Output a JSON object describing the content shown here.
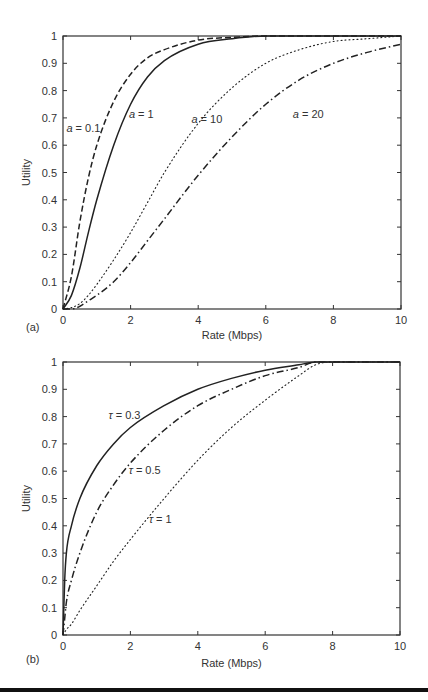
{
  "chart_data": [
    {
      "type": "line",
      "panel_label": "(a)",
      "title": "",
      "xlabel": "Rate (Mbps)",
      "ylabel": "Utility",
      "xlim": [
        0,
        10
      ],
      "ylim": [
        0,
        1
      ],
      "xticks": [
        0,
        2,
        4,
        6,
        8,
        10
      ],
      "yticks": [
        0,
        0.1,
        0.2,
        0.3,
        0.4,
        0.5,
        0.6,
        0.7,
        0.8,
        0.9,
        1
      ],
      "grid": false,
      "legend": "inline annotations",
      "x": [
        0,
        0.25,
        0.5,
        0.75,
        1,
        1.5,
        2,
        2.5,
        3,
        4,
        5,
        6,
        7,
        8,
        9,
        10
      ],
      "series": [
        {
          "name": "a = 0.1",
          "style": "dashed",
          "values": [
            0,
            0.12,
            0.32,
            0.48,
            0.6,
            0.76,
            0.86,
            0.92,
            0.95,
            0.985,
            0.995,
            1,
            1,
            1,
            1,
            1
          ]
        },
        {
          "name": "a = 1",
          "style": "solid",
          "values": [
            0,
            0.05,
            0.15,
            0.28,
            0.4,
            0.6,
            0.75,
            0.85,
            0.91,
            0.97,
            0.99,
            1,
            1,
            1,
            1,
            1
          ]
        },
        {
          "name": "a = 10",
          "style": "dotted",
          "values": [
            0,
            0.005,
            0.02,
            0.05,
            0.09,
            0.18,
            0.28,
            0.39,
            0.5,
            0.68,
            0.81,
            0.9,
            0.95,
            0.98,
            0.99,
            1
          ]
        },
        {
          "name": "a = 20",
          "style": "dashdot",
          "values": [
            0,
            0.0,
            0.01,
            0.03,
            0.05,
            0.1,
            0.17,
            0.25,
            0.33,
            0.49,
            0.63,
            0.75,
            0.84,
            0.9,
            0.94,
            0.97
          ]
        }
      ],
      "annotations": [
        {
          "text": "a = 0.1",
          "x": 0.1,
          "y": 0.65
        },
        {
          "text": "a = 1",
          "x": 1.95,
          "y": 0.7
        },
        {
          "text": "a = 10",
          "x": 3.8,
          "y": 0.68
        },
        {
          "text": "a = 20",
          "x": 6.8,
          "y": 0.7
        }
      ]
    },
    {
      "type": "line",
      "panel_label": "(b)",
      "title": "",
      "xlabel": "Rate (Mbps)",
      "ylabel": "Utility",
      "xlim": [
        0,
        10
      ],
      "ylim": [
        0,
        1
      ],
      "xticks": [
        0,
        2,
        4,
        6,
        8,
        10
      ],
      "yticks": [
        0,
        0.1,
        0.2,
        0.3,
        0.4,
        0.5,
        0.6,
        0.7,
        0.8,
        0.9,
        1
      ],
      "grid": false,
      "legend": "inline annotations",
      "x": [
        0,
        0.05,
        0.1,
        0.25,
        0.5,
        1,
        1.5,
        2,
        3,
        4,
        5,
        6,
        7,
        7.5,
        8,
        10
      ],
      "series": [
        {
          "name": "τ = 0.3",
          "style": "solid",
          "values": [
            0,
            0.2,
            0.3,
            0.4,
            0.5,
            0.62,
            0.7,
            0.76,
            0.84,
            0.9,
            0.94,
            0.97,
            0.99,
            1,
            1,
            1
          ]
        },
        {
          "name": "τ = 0.5",
          "style": "dashdot",
          "values": [
            0,
            0.06,
            0.12,
            0.2,
            0.3,
            0.45,
            0.55,
            0.63,
            0.75,
            0.84,
            0.9,
            0.95,
            0.98,
            1,
            1,
            1
          ]
        },
        {
          "name": "τ = 1",
          "style": "dotted",
          "values": [
            0,
            0.01,
            0.02,
            0.04,
            0.09,
            0.18,
            0.27,
            0.35,
            0.5,
            0.64,
            0.76,
            0.86,
            0.95,
            0.99,
            1,
            1
          ]
        }
      ],
      "annotations": [
        {
          "text": "τ = 0.3",
          "x": 1.35,
          "y": 0.79
        },
        {
          "text": "τ = 0.5",
          "x": 1.95,
          "y": 0.59
        },
        {
          "text": "τ = 1",
          "x": 2.55,
          "y": 0.41
        }
      ]
    }
  ],
  "panels": {
    "a": {
      "label": "(a)",
      "xlabel": "Rate (Mbps)",
      "ylabel": "Utility",
      "annotations": [
        "a = 0.1",
        "a = 1",
        "a = 10",
        "a = 20"
      ]
    },
    "b": {
      "label": "(b)",
      "xlabel": "Rate (Mbps)",
      "ylabel": "Utility",
      "annotations": [
        "τ = 0.3",
        "τ = 0.5",
        "τ = 1"
      ]
    }
  }
}
